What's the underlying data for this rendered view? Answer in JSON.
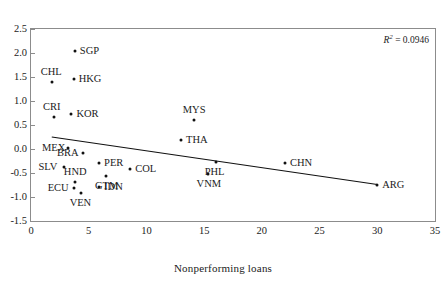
{
  "chart_data": {
    "type": "scatter",
    "title": "",
    "xlabel": "Nonperforming loans",
    "ylabel": "",
    "xlim": [
      0,
      35
    ],
    "ylim": [
      -1.5,
      2.5
    ],
    "xticks": [
      "0",
      "5",
      "10",
      "15",
      "20",
      "25",
      "30",
      "35"
    ],
    "xtick_values": [
      0,
      5,
      10,
      15,
      20,
      25,
      30,
      35
    ],
    "yticks": [
      "2.5",
      "2.0",
      "1.5",
      "1.0",
      "0.5",
      "0.0",
      "-0.5",
      "-1.0",
      "-1.5"
    ],
    "ytick_values": [
      2.5,
      2.0,
      1.5,
      1.0,
      0.5,
      0.0,
      -0.5,
      -1.0,
      -1.5
    ],
    "grid": false,
    "legend": null,
    "annotations": [
      {
        "name": "r2-annotation",
        "text_prefix": "R",
        "text_sup": "2",
        "text_suffix": " = 0.0946",
        "value": 0.0946
      }
    ],
    "trendline": {
      "name": "regression-line",
      "x_start": 1.8,
      "y_start": 0.25,
      "x_end": 30.0,
      "y_end": -0.74
    },
    "points": [
      {
        "label": "SGP",
        "x": 3.8,
        "y": 2.05,
        "label_pos": "right"
      },
      {
        "label": "CHL",
        "x": 1.8,
        "y": 1.4,
        "label_pos": "above"
      },
      {
        "label": "HKG",
        "x": 3.7,
        "y": 1.45,
        "label_pos": "right"
      },
      {
        "label": "CRI",
        "x": 2.0,
        "y": 0.66,
        "label_pos": "above"
      },
      {
        "label": "KOR",
        "x": 3.5,
        "y": 0.72,
        "label_pos": "right"
      },
      {
        "label": "MYS",
        "x": 14.1,
        "y": 0.6,
        "label_pos": "above"
      },
      {
        "label": "THA",
        "x": 13.0,
        "y": 0.18,
        "label_pos": "right"
      },
      {
        "label": "MEX",
        "x": 3.2,
        "y": 0.02,
        "label_pos": "left"
      },
      {
        "label": "BRA",
        "x": 4.5,
        "y": -0.08,
        "label_pos": "left"
      },
      {
        "label": "SLV",
        "x": 2.9,
        "y": -0.37,
        "label_pos": "left"
      },
      {
        "label": "PER",
        "x": 5.9,
        "y": -0.3,
        "label_pos": "right"
      },
      {
        "label": "COL",
        "x": 8.6,
        "y": -0.42,
        "label_pos": "right"
      },
      {
        "label": "PHL",
        "x": 16.0,
        "y": -0.27,
        "label_pos": "below"
      },
      {
        "label": "CHN",
        "x": 22.0,
        "y": -0.3,
        "label_pos": "right"
      },
      {
        "label": "HND",
        "x": 3.8,
        "y": -0.68,
        "label_pos": "above"
      },
      {
        "label": "GTM",
        "x": 6.5,
        "y": -0.57,
        "label_pos": "below"
      },
      {
        "label": "IDN",
        "x": 5.9,
        "y": -0.8,
        "label_pos": "right"
      },
      {
        "label": "ECU",
        "x": 3.7,
        "y": -0.81,
        "label_pos": "left"
      },
      {
        "label": "VEN",
        "x": 4.3,
        "y": -0.92,
        "label_pos": "below"
      },
      {
        "label": "VNM",
        "x": 15.3,
        "y": -0.52,
        "label_pos": "below"
      },
      {
        "label": "ARG",
        "x": 30.0,
        "y": -0.75,
        "label_pos": "right"
      }
    ]
  }
}
